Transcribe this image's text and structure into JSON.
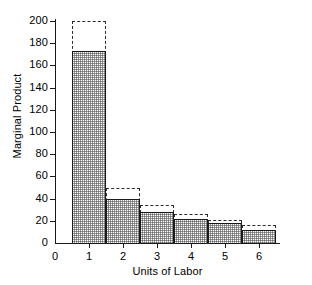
{
  "chart_data": {
    "type": "bar",
    "title": "",
    "xlabel": "Units of Labor",
    "ylabel": "Marginal Product",
    "categories": [
      "1",
      "2",
      "3",
      "4",
      "5",
      "6"
    ],
    "series": [
      {
        "name": "actual-marginal-product",
        "style": "solid-shaded",
        "values": [
          173,
          40,
          28,
          22,
          18,
          12
        ]
      },
      {
        "name": "potential-marginal-product",
        "style": "dashed-outline",
        "values": [
          200,
          50,
          34,
          26,
          21,
          16
        ]
      }
    ],
    "xlim": [
      0,
      6.5
    ],
    "ylim": [
      0,
      200
    ],
    "yticks": [
      0,
      20,
      40,
      60,
      80,
      100,
      120,
      140,
      160,
      180,
      200
    ],
    "ytick_labels": [
      "0",
      "20",
      "40",
      "60",
      "80",
      "100",
      "120",
      "140",
      "160",
      "180",
      "200"
    ],
    "xticks": [
      0,
      1,
      2,
      3,
      4,
      5,
      6
    ],
    "xtick_labels": [
      "0",
      "1",
      "2",
      "3",
      "4",
      "5",
      "6"
    ],
    "grid": false,
    "legend": "none",
    "colors": {
      "axis": "#1a1a1a",
      "bar_fill": "#b8b8b8",
      "bar_edge": "#1a1a1a",
      "dashed_edge": "#2b2b2b",
      "background": "#ffffff"
    }
  }
}
